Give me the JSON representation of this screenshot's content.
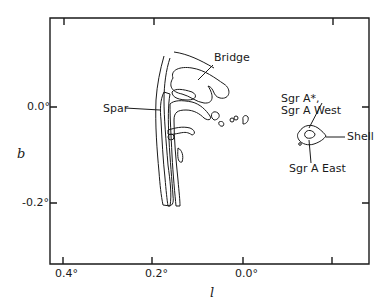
{
  "figure": {
    "type": "contour-map",
    "x_axis": {
      "label": "l",
      "ticks": [
        "0.4°",
        "0.2°",
        "0.0°"
      ]
    },
    "y_axis": {
      "label": "b",
      "ticks": [
        "0.0°",
        "-0.2°"
      ]
    },
    "annotations": {
      "bridge": "Bridge",
      "spar": "Spar",
      "sgr_a_star_line1": "Sgr A*,",
      "sgr_a_star_line2": "Sgr A West",
      "shell": "Shell",
      "sgr_a_east": "Sgr A East"
    },
    "colors": {
      "line": "#1a1a1a",
      "background": "#ffffff"
    }
  }
}
